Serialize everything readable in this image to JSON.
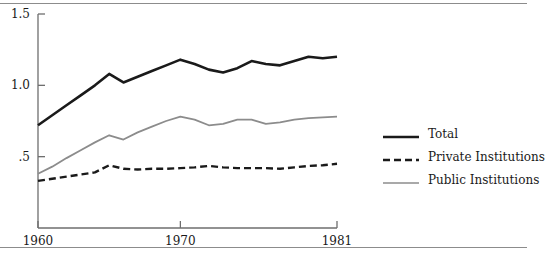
{
  "chart_data": {
    "type": "line",
    "title": "",
    "subtitle": "",
    "xlabel": "",
    "ylabel": "",
    "xlim": [
      1960,
      1981
    ],
    "ylim": [
      0,
      1.5
    ],
    "grid": false,
    "legend_position": "right",
    "x_ticks": [
      "1960",
      "1970",
      "1981"
    ],
    "x_tick_values": [
      1960,
      1970,
      1981
    ],
    "y_ticks": [
      ".5",
      "1.0",
      "1.5"
    ],
    "y_tick_values": [
      0.5,
      1.0,
      1.5
    ],
    "x": [
      1960,
      1961,
      1962,
      1963,
      1964,
      1965,
      1966,
      1967,
      1968,
      1969,
      1970,
      1971,
      1972,
      1973,
      1974,
      1975,
      1976,
      1977,
      1978,
      1979,
      1980,
      1981
    ],
    "series": [
      {
        "name": "Total",
        "style": "solid",
        "color": "#1a1a1a",
        "width": 2.6,
        "values": [
          0.72,
          0.79,
          0.86,
          0.93,
          1.0,
          1.08,
          1.02,
          1.06,
          1.1,
          1.14,
          1.18,
          1.15,
          1.11,
          1.09,
          1.12,
          1.17,
          1.15,
          1.14,
          1.17,
          1.2,
          1.19,
          1.2
        ]
      },
      {
        "name": "Private Institutions",
        "style": "dashed",
        "color": "#1a1a1a",
        "width": 2.4,
        "values": [
          0.33,
          0.345,
          0.36,
          0.375,
          0.39,
          0.44,
          0.415,
          0.41,
          0.415,
          0.415,
          0.42,
          0.425,
          0.435,
          0.425,
          0.42,
          0.42,
          0.42,
          0.415,
          0.425,
          0.435,
          0.44,
          0.45
        ]
      },
      {
        "name": "Public Institutions",
        "style": "solid",
        "color": "#8c8c8c",
        "width": 1.8,
        "values": [
          0.38,
          0.43,
          0.49,
          0.545,
          0.6,
          0.65,
          0.62,
          0.67,
          0.71,
          0.75,
          0.78,
          0.76,
          0.72,
          0.73,
          0.76,
          0.76,
          0.73,
          0.74,
          0.76,
          0.77,
          0.775,
          0.78
        ]
      }
    ],
    "legend": [
      {
        "label": "Total",
        "style": "solid",
        "color": "#1a1a1a"
      },
      {
        "label": "Private Institutions",
        "style": "dashed",
        "color": "#1a1a1a"
      },
      {
        "label": "Public Institutions",
        "style": "solid",
        "color": "#8c8c8c"
      }
    ]
  },
  "axis": {
    "y_labels": [
      {
        "text": "1.5"
      },
      {
        "text": "1.0"
      },
      {
        "text": ".5"
      }
    ],
    "x_labels": [
      {
        "text": "1960"
      },
      {
        "text": "1970"
      },
      {
        "text": "1981"
      }
    ]
  },
  "colors": {
    "total": "#1a1a1a",
    "private": "#1a1a1a",
    "public": "#8c8c8c",
    "axis": "#6e6e6e",
    "rule": "#8c8c8c"
  }
}
